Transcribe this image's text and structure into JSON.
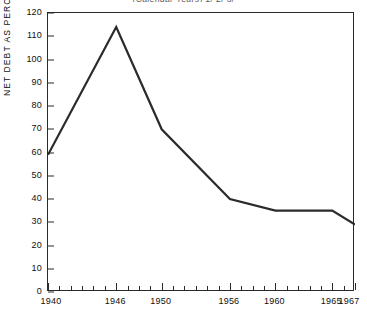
{
  "chart_data": {
    "type": "line",
    "title": "(Calendar Years) 1/ 2/ 3/",
    "xlabel": "",
    "ylabel": "NET DEBT AS PERCENT OF GNP",
    "x": [
      1940,
      1946,
      1950,
      1956,
      1960,
      1965,
      1967
    ],
    "values": [
      59,
      114,
      70,
      40,
      35,
      35,
      29
    ],
    "series": [
      {
        "name": "Net debt as percent of GNP",
        "values": [
          59,
          114,
          70,
          40,
          35,
          35,
          29
        ]
      }
    ],
    "xlim": [
      1940,
      1967
    ],
    "ylim": [
      0,
      120
    ],
    "ytick_labels": [
      "0",
      "10",
      "20",
      "30",
      "40",
      "50",
      "60",
      "70",
      "80",
      "90",
      "100",
      "110",
      "120"
    ],
    "ytick_values": [
      0,
      10,
      20,
      30,
      40,
      50,
      60,
      70,
      80,
      90,
      100,
      110,
      120
    ],
    "xtick_labels": [
      "1940",
      "1946",
      "1950",
      "1956",
      "1960",
      "1965",
      "1967"
    ],
    "xtick_values": [
      1940,
      1946,
      1950,
      1956,
      1960,
      1965,
      1967
    ],
    "xtick_minor_values": [
      1941,
      1942,
      1943,
      1944,
      1945,
      1947,
      1948,
      1949,
      1951,
      1952,
      1953,
      1954,
      1955,
      1957,
      1958,
      1959,
      1961,
      1962,
      1963,
      1964,
      1966
    ],
    "grid": false,
    "legend": false,
    "line_color": "#2b2b2b",
    "line_width": 2.2,
    "background": "#ffffff",
    "axis_color": "#2b2b2b"
  }
}
